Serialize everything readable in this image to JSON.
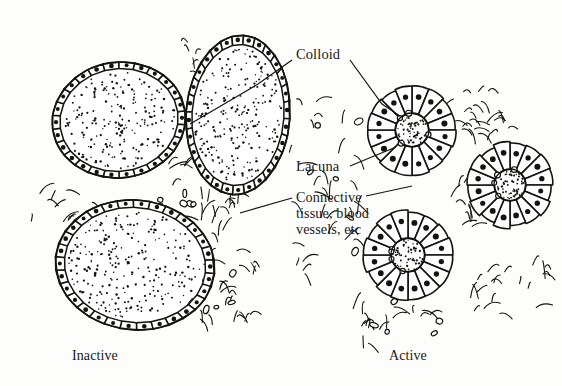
{
  "figure": {
    "background_color": "#fdfdfc",
    "ink_color": "#14130f"
  },
  "labels": {
    "colloid": "Colloid",
    "lacuna": "Lacuna",
    "connective_line1": "Connective",
    "connective_line2": "tissue, blood",
    "connective_line3": "vessels, etc",
    "inactive": "Inactive",
    "active": "Active"
  },
  "structures": {
    "inactive_follicles": [
      {
        "name": "upper-left-follicle",
        "cx": 119,
        "cy": 120,
        "rx": 67,
        "ry": 58,
        "rotation": -8,
        "cells": 26,
        "colloid_stipple": 210
      },
      {
        "name": "upper-right-follicle",
        "cx": 238,
        "cy": 115,
        "rx": 52,
        "ry": 80,
        "rotation": 4,
        "cells": 28,
        "colloid_stipple": 230
      },
      {
        "name": "lower-follicle",
        "cx": 135,
        "cy": 265,
        "rx": 80,
        "ry": 65,
        "rotation": 6,
        "cells": 30,
        "colloid_stipple": 260
      }
    ],
    "active_follicles": [
      {
        "name": "active-follicle-top",
        "cx": 412,
        "cy": 130,
        "r": 44,
        "cells": 16,
        "lumen_r": 17,
        "colloid_stipple": 60
      },
      {
        "name": "active-follicle-right",
        "cx": 510,
        "cy": 185,
        "r": 42,
        "cells": 16,
        "lumen_r": 16,
        "colloid_stipple": 55
      },
      {
        "name": "active-follicle-bottom",
        "cx": 408,
        "cy": 255,
        "r": 44,
        "cells": 16,
        "lumen_r": 17,
        "colloid_stipple": 58
      }
    ],
    "leader_lines": [
      {
        "name": "colloid-leader-left",
        "points": "292,60 258,84 248,90 190,124"
      },
      {
        "name": "colloid-leader-right",
        "points": "350,60 382,104 400,116"
      },
      {
        "name": "lacuna-leader",
        "points": "350,166 396,147"
      },
      {
        "name": "connective-leader-left",
        "points": "292,198 240,213"
      },
      {
        "name": "connective-leader-right",
        "points": "366,196 412,186"
      }
    ]
  }
}
